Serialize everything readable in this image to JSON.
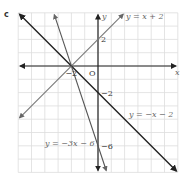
{
  "part_label": "c",
  "chart_data": {
    "type": "line",
    "title": "",
    "xlabel": "x",
    "ylabel": "y",
    "xlim": [
      -6,
      6
    ],
    "ylim": [
      -8,
      4
    ],
    "grid": true,
    "origin_label": "O",
    "tick_labels": {
      "x": [
        {
          "value": -2,
          "label": "−2"
        }
      ],
      "y": [
        {
          "value": 2,
          "label": "2"
        },
        {
          "value": -2,
          "label": "−2"
        },
        {
          "value": -6,
          "label": "−6"
        }
      ]
    },
    "series": [
      {
        "name": "y = x + 2",
        "slope": 1,
        "intercept": 2,
        "color": "#777777"
      },
      {
        "name": "y = −x − 2",
        "slope": -1,
        "intercept": -2,
        "color": "#222222"
      },
      {
        "name": "y = −3x − 6",
        "slope": -3,
        "intercept": -6,
        "color": "#555555"
      }
    ],
    "annotations": [
      {
        "text": "y = x + 2",
        "near": "top-right"
      },
      {
        "text": "y = −x − 2",
        "near": "right-middle"
      },
      {
        "text": "y = −3x − 6",
        "near": "bottom-left-center"
      }
    ]
  }
}
